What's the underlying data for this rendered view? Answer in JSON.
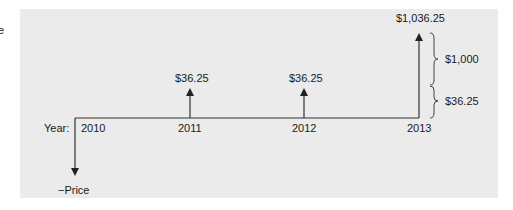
{
  "edge_fragment": "e",
  "timeline": {
    "axis_label": "Year:",
    "years": [
      "2010",
      "2011",
      "2012",
      "2013"
    ],
    "outflow_label": "−Price",
    "cash_flows": [
      {
        "year": "2010",
        "direction": "down",
        "label": "−Price"
      },
      {
        "year": "2011",
        "direction": "up",
        "label": "$36.25"
      },
      {
        "year": "2012",
        "direction": "up",
        "label": "$36.25"
      },
      {
        "year": "2013",
        "direction": "up",
        "label": "$1,036.25"
      }
    ],
    "breakdown": [
      {
        "label": "$1,000",
        "component": "principal"
      },
      {
        "label": "$36.25",
        "component": "coupon"
      }
    ]
  },
  "colors": {
    "panel": "#ebebeb",
    "line": "#333333",
    "text": "#1a1a1a"
  }
}
